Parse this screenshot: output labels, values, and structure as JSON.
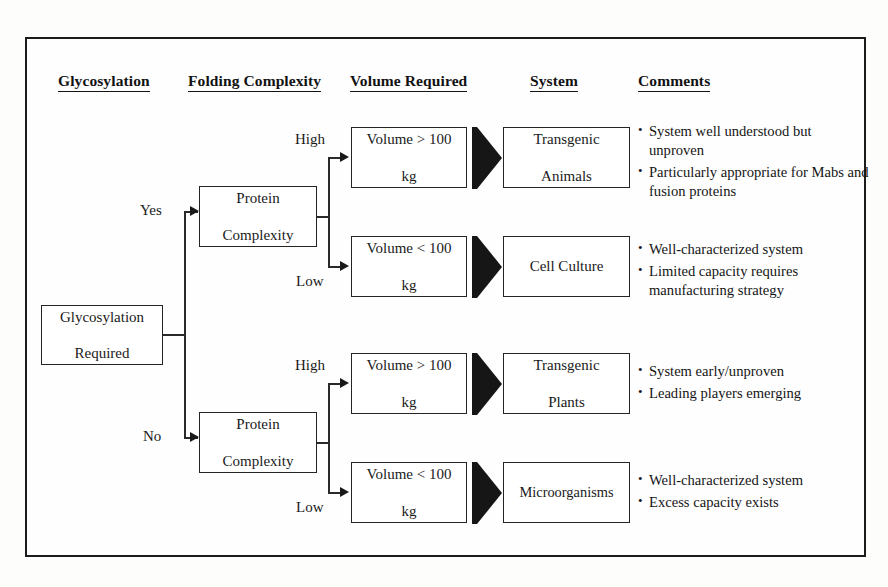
{
  "diagram": {
    "headers": [
      {
        "label": "Glycosylation"
      },
      {
        "label": "Folding Complexity"
      },
      {
        "label": "Volume Required"
      },
      {
        "label": "System"
      },
      {
        "label": "Comments"
      }
    ],
    "root": {
      "label_line1": "Glycosylation",
      "label_line2": "Required"
    },
    "branches": [
      {
        "edge_label": "Yes",
        "decision": {
          "label_line1": "Protein",
          "label_line2": "Complexity"
        },
        "outcomes": [
          {
            "edge_label": "High",
            "volume_line1": "Volume > 100",
            "volume_line2": "kg",
            "system_line1": "Transgenic",
            "system_line2": "Animals",
            "comments": [
              "System well understood but unproven",
              "Particularly appropriate for Mabs and fusion proteins"
            ]
          },
          {
            "edge_label": "Low",
            "volume_line1": "Volume < 100",
            "volume_line2": "kg",
            "system_line1": "Cell Culture",
            "system_line2": "",
            "comments": [
              "Well-characterized system",
              "Limited capacity requires manufacturing strategy"
            ]
          }
        ]
      },
      {
        "edge_label": "No",
        "decision": {
          "label_line1": "Protein",
          "label_line2": "Complexity"
        },
        "outcomes": [
          {
            "edge_label": "High",
            "volume_line1": "Volume > 100",
            "volume_line2": "kg",
            "system_line1": "Transgenic",
            "system_line2": "Plants",
            "comments": [
              "System early/unproven",
              "Leading players emerging"
            ]
          },
          {
            "edge_label": "Low",
            "volume_line1": "Volume < 100",
            "volume_line2": "kg",
            "system_line1": "Microorganisms",
            "system_line2": "",
            "comments": [
              "Well-characterized system",
              "Excess capacity exists"
            ]
          }
        ]
      }
    ],
    "bullet_glyph": "•",
    "colors": {
      "ink": "#1a1a1a",
      "line": "#2a2a2a",
      "arrow_fill": "#191919",
      "page_background": "#fefefe",
      "canvas_background": "#fdfdfc"
    }
  }
}
